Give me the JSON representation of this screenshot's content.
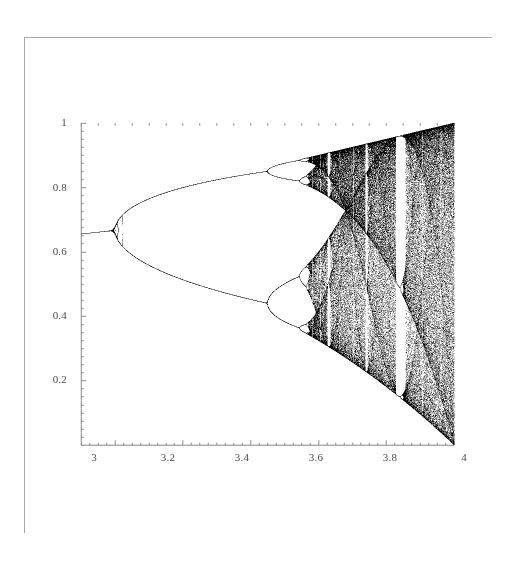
{
  "figure": {
    "title": "",
    "frame_color": "#a8a8a8",
    "background_color": "#ffffff",
    "point_color": "#1a1a1a",
    "axis_color": "#8a8a8a",
    "label_color": "#4a4a4a"
  },
  "chart_data": {
    "type": "scatter",
    "title": "",
    "subtitle": "",
    "xlabel": "",
    "ylabel": "",
    "equation": "x_{n+1} = r x_n (1 - x_n)",
    "xlim": [
      2.9,
      4.0
    ],
    "ylim": [
      0.0,
      1.0
    ],
    "grid": false,
    "legend": null,
    "x_ticks": [
      3,
      3.2,
      3.4,
      3.6,
      3.8,
      4
    ],
    "x_tick_labels": [
      "3",
      "3.2",
      "3.4",
      "3.6",
      "3.8",
      "4"
    ],
    "y_ticks": [
      0.2,
      0.4,
      0.6,
      0.8,
      1
    ],
    "y_tick_labels": [
      "0.2",
      "0.4",
      "0.6",
      "0.8",
      "1"
    ],
    "x_minor_tick_step": 0.025,
    "y_minor_tick_step": 0.025,
    "axis_origin_x": 2.9,
    "axis_origin_y": 0.0,
    "parameter_name": "r",
    "variable_name": "x",
    "r_min": 2.9,
    "r_max": 4.0,
    "x_samples": 740,
    "iterations_transient": 300,
    "iterations_plotted": 260,
    "features": {
      "fixed_point_value_at_r3": 0.667,
      "bifurcation_points": [
        {
          "r": 3.0,
          "period": 2,
          "label": "first period-doubling"
        },
        {
          "r": 3.449,
          "period": 4,
          "label": "second period-doubling"
        },
        {
          "r": 3.544,
          "period": 8,
          "label": "third period-doubling"
        },
        {
          "r": 3.5644,
          "period": 16,
          "label": "fourth period-doubling"
        },
        {
          "r": 3.5699,
          "period": null,
          "label": "onset of chaos (Feigenbaum point)"
        }
      ],
      "periodic_windows": [
        {
          "r_start": 3.627,
          "r_end": 3.635,
          "period": 6
        },
        {
          "r_start": 3.701,
          "r_end": 3.712,
          "period": 7
        },
        {
          "r_start": 3.738,
          "r_end": 3.745,
          "period": 5
        },
        {
          "r_start": 3.828,
          "r_end": 3.857,
          "period": 3
        },
        {
          "r_start": 3.96,
          "r_end": 3.964,
          "period": 4
        }
      ],
      "upper_envelope_at_r4": 1.0,
      "lower_envelope_at_r4": 0.0
    }
  },
  "axes": {
    "y_labels": [
      {
        "text": "1",
        "value": 1.0
      },
      {
        "text": "0.8",
        "value": 0.8
      },
      {
        "text": "0.6",
        "value": 0.6
      },
      {
        "text": "0.4",
        "value": 0.4
      },
      {
        "text": "0.2",
        "value": 0.2
      }
    ],
    "x_labels": [
      {
        "text": "3",
        "value": 3.0
      },
      {
        "text": "3.2",
        "value": 3.2
      },
      {
        "text": "3.4",
        "value": 3.4
      },
      {
        "text": "3.6",
        "value": 3.6
      },
      {
        "text": "3.8",
        "value": 3.8
      },
      {
        "text": "4",
        "value": 4.0
      }
    ]
  }
}
